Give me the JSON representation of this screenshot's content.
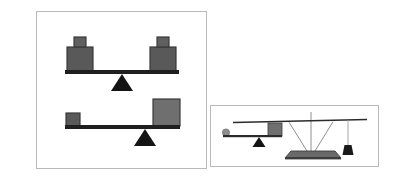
{
  "figure": {
    "title": "",
    "background_color": "#ffffff",
    "width": 393,
    "height": 195
  },
  "palette": {
    "panel_border": "#b9b9b9",
    "panel_background": "#ffffff",
    "beam_dark": "#1f1f1f",
    "block_gray": "#595959",
    "block_gray_light": "#6f6f6f",
    "block_outline": "#3a3a3a",
    "fulcrum_dark": "#141414",
    "pan_gray": "#6a6a6a",
    "post_gray": "#9a9a9a",
    "ball_gray": "#8c8c8c",
    "weight_dark": "#1a1a1a",
    "string_gray": "#a8a8a8"
  },
  "panels": [
    {
      "id": "panel-left",
      "name": "lever-diagram-panel",
      "label": "",
      "scenes": [
        {
          "id": "balanced-lever",
          "name": "balanced-lever-scene",
          "description": "level beam on centered fulcrum with equal stacked blocks on both ends",
          "state": "balanced",
          "beam": {
            "x1": 28,
            "y1": 60,
            "x2": 142,
            "y2": 60,
            "thickness": 4,
            "tilt_deg": 0
          },
          "fulcrum": {
            "x": 85,
            "y": 62,
            "width": 22,
            "height": 17
          },
          "loads": [
            {
              "name": "left-load-stack",
              "side": "left",
              "blocks": [
                {
                  "name": "large-block",
                  "x": 30,
                  "y": 35,
                  "width": 26,
                  "height": 24
                },
                {
                  "name": "small-block-cap",
                  "x": 37,
                  "y": 25,
                  "width": 12,
                  "height": 10
                }
              ]
            },
            {
              "name": "right-load-stack",
              "side": "right",
              "blocks": [
                {
                  "name": "large-block",
                  "x": 113,
                  "y": 35,
                  "width": 26,
                  "height": 24
                },
                {
                  "name": "small-block-cap",
                  "x": 120,
                  "y": 25,
                  "width": 12,
                  "height": 10
                }
              ]
            }
          ]
        },
        {
          "id": "tilted-lever",
          "name": "unbalanced-lever-scene",
          "description": "beam on off-center fulcrum, small block at left end, large block at right end",
          "state": "unbalanced",
          "beam": {
            "x1": 28,
            "y1": 115,
            "x2": 142,
            "y2": 115,
            "thickness": 4,
            "tilt_deg": 0
          },
          "fulcrum": {
            "x": 108,
            "y": 117,
            "width": 22,
            "height": 17
          },
          "loads": [
            {
              "name": "left-load-small",
              "side": "left",
              "blocks": [
                {
                  "name": "small-block",
                  "x": 29,
                  "y": 101,
                  "width": 14,
                  "height": 13
                }
              ]
            },
            {
              "name": "right-load-large",
              "side": "right",
              "blocks": [
                {
                  "name": "large-block",
                  "x": 116,
                  "y": 87,
                  "width": 27,
                  "height": 27
                }
              ]
            }
          ]
        }
      ]
    },
    {
      "id": "panel-right",
      "name": "balance-scale-panel",
      "label": "",
      "scenes": [
        {
          "id": "ball-lever",
          "name": "ball-and-box-lever-scene",
          "description": "lever with small ball on left end, box on right end, fulcrum right of center",
          "state": "unbalanced",
          "beam": {
            "x1": 12,
            "y1": 30,
            "x2": 68,
            "y2": 30,
            "thickness": 2,
            "tilt_deg": 0
          },
          "fulcrum": {
            "x": 48,
            "y": 31,
            "width": 13,
            "height": 10
          },
          "loads": [
            {
              "name": "ball-weight",
              "shape": "circle",
              "cx": 15,
              "cy": 27,
              "r": 3.5
            },
            {
              "name": "box-weight",
              "shape": "rect",
              "x": 57,
              "y": 17,
              "width": 14,
              "height": 13
            }
          ]
        },
        {
          "id": "pan-balance",
          "name": "pan-balance-scene",
          "description": "balance scale with triangular support, loaded pan at left and hanging weight at right",
          "state": "tilted-left",
          "beam": {
            "x1": 22,
            "y1": 15,
            "x2": 155,
            "y2": 15,
            "thickness": 2,
            "tilt_deg": -2
          },
          "support": {
            "name": "vertical-post",
            "x": 100,
            "y_top": 8,
            "y_bottom": 47
          },
          "pan": {
            "name": "weighing-pan",
            "x": 76,
            "y": 45,
            "width": 48,
            "height": 7
          },
          "hanging_weight": {
            "name": "hanging-weight",
            "string_x": 137,
            "string_top": 17,
            "string_bottom": 39,
            "x": 132,
            "y": 39,
            "width": 11,
            "height": 10
          }
        }
      ]
    }
  ]
}
